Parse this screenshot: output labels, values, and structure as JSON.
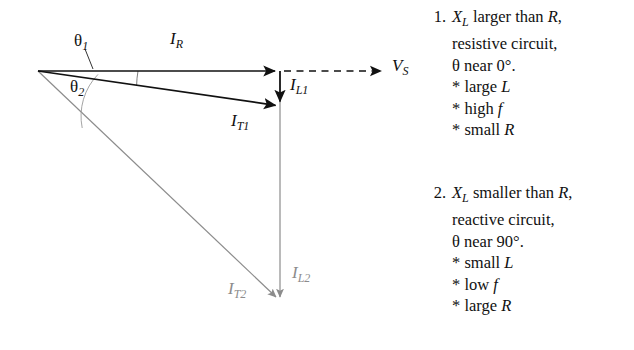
{
  "figure": {
    "type": "phasor-diagram",
    "origin": {
      "x": 38,
      "y": 71
    },
    "vectors": [
      {
        "id": "IR",
        "label": "I",
        "subscript": "R",
        "color": "#111111",
        "style": "solid",
        "from": {
          "x": 38,
          "y": 71
        },
        "to": {
          "x": 280,
          "y": 71
        },
        "label_pos": {
          "x": 170,
          "y": 30
        }
      },
      {
        "id": "VS",
        "label": "V",
        "subscript": "S",
        "color": "#111111",
        "style": "dashed",
        "from": {
          "x": 283,
          "y": 71
        },
        "to": {
          "x": 386,
          "y": 71
        },
        "label_pos": {
          "x": 392,
          "y": 57
        }
      },
      {
        "id": "IL1",
        "label": "I",
        "subscript": "L1",
        "color": "#111111",
        "style": "solid",
        "from": {
          "x": 280,
          "y": 71
        },
        "to": {
          "x": 280,
          "y": 106
        },
        "label_pos": {
          "x": 290,
          "y": 76
        }
      },
      {
        "id": "IT1",
        "label": "I",
        "subscript": "T1",
        "color": "#111111",
        "style": "solid",
        "from": {
          "x": 38,
          "y": 71
        },
        "to": {
          "x": 280,
          "y": 106
        },
        "label_pos": {
          "x": 231,
          "y": 112
        }
      },
      {
        "id": "IL2",
        "label": "I",
        "subscript": "L2",
        "color": "#8c8c8c",
        "style": "solid",
        "from": {
          "x": 280,
          "y": 71
        },
        "to": {
          "x": 280,
          "y": 301
        },
        "label_pos": {
          "x": 292,
          "y": 264
        }
      },
      {
        "id": "IT2",
        "label": "I",
        "subscript": "T2",
        "color": "#8c8c8c",
        "style": "solid",
        "from": {
          "x": 38,
          "y": 71
        },
        "to": {
          "x": 280,
          "y": 301
        },
        "label_pos": {
          "x": 228,
          "y": 280
        }
      }
    ],
    "angles": [
      {
        "id": "theta1",
        "symbol": "θ",
        "subscript": "1",
        "label_pos": {
          "x": 74,
          "y": 32
        },
        "arc_radius": 100,
        "between": [
          "IR",
          "IT1"
        ]
      },
      {
        "id": "theta2",
        "symbol": "θ",
        "subscript": "2",
        "label_pos": {
          "x": 70,
          "y": 78
        },
        "arc_radius": 60,
        "between": [
          "IR",
          "IT2"
        ]
      }
    ]
  },
  "notes": [
    {
      "number": "1.",
      "lines": [
        {
          "segments": [
            {
              "t": "X",
              "style": "italic"
            },
            {
              "t": "L",
              "style": "sub"
            },
            {
              "t": " larger than ",
              "style": "roman"
            },
            {
              "t": "R",
              "style": "italic"
            },
            {
              "t": ",",
              "style": "roman"
            }
          ]
        },
        {
          "segments": [
            {
              "t": "resistive circuit,",
              "style": "roman"
            }
          ]
        },
        {
          "segments": [
            {
              "t": "θ near 0°.",
              "style": "roman"
            }
          ]
        },
        {
          "segments": [
            {
              "t": "* large ",
              "style": "roman"
            },
            {
              "t": "L",
              "style": "italic"
            }
          ]
        },
        {
          "segments": [
            {
              "t": "* high ",
              "style": "roman"
            },
            {
              "t": "f",
              "style": "italic"
            }
          ]
        },
        {
          "segments": [
            {
              "t": "* small ",
              "style": "roman"
            },
            {
              "t": "R",
              "style": "italic"
            }
          ]
        }
      ]
    },
    {
      "number": "2.",
      "lines": [
        {
          "segments": [
            {
              "t": "X",
              "style": "italic"
            },
            {
              "t": "L",
              "style": "sub"
            },
            {
              "t": " smaller than ",
              "style": "roman"
            },
            {
              "t": "R",
              "style": "italic"
            },
            {
              "t": ",",
              "style": "roman"
            }
          ]
        },
        {
          "segments": [
            {
              "t": "reactive circuit,",
              "style": "roman"
            }
          ]
        },
        {
          "segments": [
            {
              "t": "θ near 90°.",
              "style": "roman"
            }
          ]
        },
        {
          "segments": [
            {
              "t": "* small ",
              "style": "roman"
            },
            {
              "t": "L",
              "style": "italic"
            }
          ]
        },
        {
          "segments": [
            {
              "t": "* low ",
              "style": "roman"
            },
            {
              "t": "f",
              "style": "italic"
            }
          ]
        },
        {
          "segments": [
            {
              "t": "* large ",
              "style": "roman"
            },
            {
              "t": "R",
              "style": "italic"
            }
          ]
        }
      ]
    }
  ],
  "colors": {
    "ink_black": "#111111",
    "ink_gray": "#8c8c8c",
    "background": "#ffffff"
  }
}
